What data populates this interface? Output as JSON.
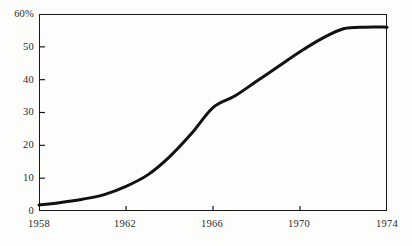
{
  "chart_data": {
    "type": "line",
    "title": "",
    "subtitle": "",
    "xlabel": "",
    "ylabel": "",
    "xlim": [
      1958,
      1974
    ],
    "ylim": [
      0,
      60
    ],
    "grid": false,
    "legend": null,
    "xticks": [
      1958,
      1962,
      1966,
      1970,
      1974
    ],
    "xtick_labels": [
      "1958",
      "1962",
      "1966",
      "1970",
      "1974"
    ],
    "yticks": [
      0,
      10,
      20,
      30,
      40,
      50,
      60
    ],
    "ytick_labels": [
      "0",
      "10",
      "20",
      "30",
      "40",
      "50",
      "60%"
    ],
    "line_color": "#111111",
    "line_width": 3.0,
    "series": [
      {
        "name": "percent",
        "x": [
          1958,
          1959,
          1960,
          1961,
          1962,
          1963,
          1964,
          1965,
          1966,
          1967,
          1968,
          1969,
          1970,
          1971,
          1972,
          1973,
          1974
        ],
        "values": [
          1.8,
          2.6,
          3.6,
          5.0,
          7.5,
          11.0,
          16.5,
          23.5,
          31.5,
          35.0,
          39.5,
          44.0,
          48.5,
          52.5,
          55.5,
          56.0,
          56.0
        ]
      }
    ]
  },
  "axis": {
    "y_labels": [
      "60%",
      "50",
      "40",
      "30",
      "20",
      "10",
      "0"
    ],
    "x_labels": [
      "1958",
      "1962",
      "1966",
      "1970",
      "1974"
    ]
  }
}
